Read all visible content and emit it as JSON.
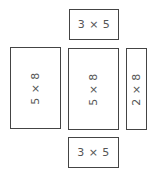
{
  "diagram": {
    "type": "net-of-rectangular-prism",
    "faces": [
      {
        "id": "top",
        "label": "3 × 5",
        "x": 69,
        "y": 9,
        "w": 50,
        "h": 31,
        "rotated": false
      },
      {
        "id": "left",
        "label": "5 × 8",
        "x": 10,
        "y": 47,
        "w": 51,
        "h": 82,
        "rotated": true
      },
      {
        "id": "center",
        "label": "5 × 8",
        "x": 68,
        "y": 48,
        "w": 51,
        "h": 82,
        "rotated": true
      },
      {
        "id": "right",
        "label": "2 × 8",
        "x": 126,
        "y": 48,
        "w": 21,
        "h": 82,
        "rotated": true
      },
      {
        "id": "bottom",
        "label": "3 × 5",
        "x": 68,
        "y": 137,
        "w": 51,
        "h": 31,
        "rotated": false
      }
    ],
    "stroke_color": "#444444",
    "text_color": "#555555"
  }
}
